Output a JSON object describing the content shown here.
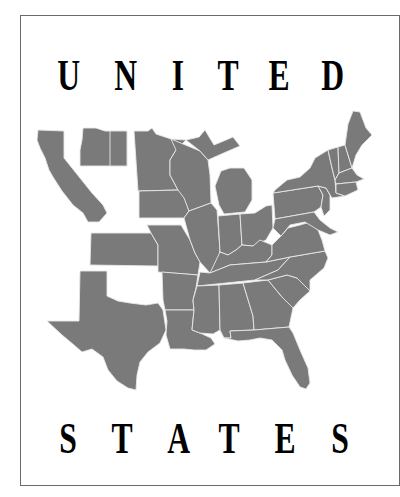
{
  "poster": {
    "top_word": "UNITED",
    "bottom_word": "STATES",
    "top_letters": [
      "U",
      "N",
      "I",
      "T",
      "E",
      "D"
    ],
    "bottom_letters": [
      "S",
      "T",
      "A",
      "T",
      "E",
      "S"
    ]
  },
  "map": {
    "subject": "map-of-united-states-partial",
    "fill_color": "#7a7a7a",
    "border_color": "#e8e8e8"
  }
}
